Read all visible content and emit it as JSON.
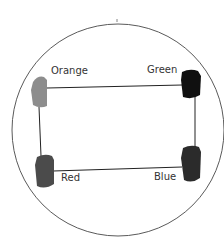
{
  "diagram": {
    "type": "circuit-loop",
    "outer_circle": {
      "cx": 118,
      "cy": 130,
      "r": 106,
      "stroke": "#555555"
    },
    "nodes": [
      {
        "id": "orange",
        "label": "Orange",
        "x": 31,
        "y": 76,
        "w": 17,
        "h": 32,
        "fill": "#8a8a8a",
        "label_x": 51,
        "label_y": 66
      },
      {
        "id": "green",
        "label": "Green",
        "x": 181,
        "y": 70,
        "w": 20,
        "h": 28,
        "fill": "#111111",
        "label_x": 147,
        "label_y": 65
      },
      {
        "id": "red",
        "label": "Red",
        "x": 35,
        "y": 155,
        "w": 19,
        "h": 33,
        "fill": "#4a4a4a",
        "label_x": 61,
        "label_y": 172
      },
      {
        "id": "blue",
        "label": "Blue",
        "x": 181,
        "y": 146,
        "w": 20,
        "h": 35,
        "fill": "#2a2a2a",
        "label_x": 154,
        "label_y": 172
      }
    ],
    "edges": [
      {
        "from": "orange",
        "to": "green"
      },
      {
        "from": "green",
        "to": "blue"
      },
      {
        "from": "blue",
        "to": "red"
      },
      {
        "from": "red",
        "to": "orange"
      }
    ]
  }
}
